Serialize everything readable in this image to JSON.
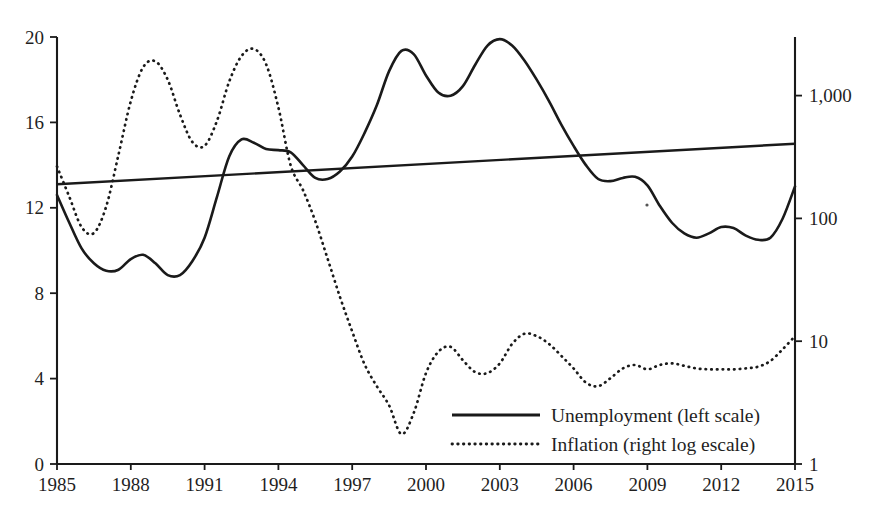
{
  "chart_data": {
    "type": "line",
    "title": "",
    "subtitle": "",
    "xlabel": "",
    "ylabel": "",
    "y2label": "",
    "xlim": [
      1985,
      2015
    ],
    "ylim": [
      0,
      20
    ],
    "y2lim": [
      1,
      3000
    ],
    "y2scale": "log",
    "grid": false,
    "legend_position": "bottom-right",
    "x_tick_labels": [
      "1985",
      "1988",
      "1991",
      "1994",
      "1997",
      "2000",
      "2003",
      "2006",
      "2009",
      "2012",
      "2015"
    ],
    "x_ticks": [
      1985,
      1988,
      1991,
      1994,
      1997,
      2000,
      2003,
      2006,
      2009,
      2012,
      2015
    ],
    "y_tick_labels": [
      "0",
      "4",
      "8",
      "12",
      "16",
      "20"
    ],
    "y_ticks": [
      0,
      4,
      8,
      12,
      16,
      20
    ],
    "y2_tick_labels": [
      "1",
      "10",
      "100",
      "1,000"
    ],
    "y2_ticks": [
      1,
      10,
      100,
      1000
    ],
    "series": [
      {
        "name": "Unemployment (left scale)",
        "axis": "left",
        "style": "solid",
        "color": "#1a1a1a",
        "x": [
          1985,
          1985.5,
          1986,
          1986.5,
          1987,
          1987.5,
          1988,
          1988.5,
          1989,
          1989.5,
          1990,
          1990.5,
          1991,
          1991.5,
          1992,
          1992.5,
          1993,
          1993.5,
          1994,
          1994.5,
          1995,
          1995.5,
          1996,
          1996.5,
          1997,
          1997.5,
          1998,
          1998.5,
          1999,
          1999.5,
          2000,
          2000.5,
          2001,
          2001.5,
          2002,
          2002.5,
          2003,
          2003.5,
          2004,
          2004.5,
          2005,
          2005.5,
          2006,
          2006.5,
          2007,
          2007.5,
          2008,
          2008.5,
          2009,
          2009.5,
          2010,
          2010.5,
          2011,
          2011.5,
          2012,
          2012.5,
          2013,
          2013.5,
          2014,
          2014.5,
          2015
        ],
        "values": [
          12.6,
          11.3,
          10.1,
          9.4,
          9.05,
          9.1,
          9.6,
          9.8,
          9.4,
          8.85,
          8.85,
          9.5,
          10.6,
          12.5,
          14.4,
          15.2,
          15.05,
          14.75,
          14.7,
          14.6,
          14.0,
          13.4,
          13.35,
          13.7,
          14.4,
          15.5,
          16.8,
          18.4,
          19.35,
          19.2,
          18.2,
          17.4,
          17.25,
          17.7,
          18.7,
          19.6,
          19.9,
          19.6,
          18.9,
          18.0,
          17.0,
          15.9,
          14.9,
          14.0,
          13.35,
          13.25,
          13.4,
          13.45,
          13.05,
          12.1,
          11.3,
          10.8,
          10.6,
          10.8,
          11.1,
          11.05,
          10.7,
          10.5,
          10.6,
          11.5,
          13.0
        ]
      },
      {
        "name": "Inflation (right log escale)",
        "axis": "right",
        "style": "dotted",
        "color": "#1a1a1a",
        "x": [
          1985,
          1985.5,
          1986,
          1986.5,
          1987,
          1987.5,
          1988,
          1988.5,
          1989,
          1989.5,
          1990,
          1990.5,
          1991,
          1991.5,
          1992,
          1992.5,
          1993,
          1993.5,
          1994,
          1994.5,
          1995,
          1995.5,
          1996,
          1996.5,
          1997,
          1997.5,
          1998,
          1998.5,
          1999,
          1999.5,
          2000,
          2000.5,
          2001,
          2001.5,
          2002,
          2002.5,
          2003,
          2003.5,
          2004,
          2004.5,
          2005,
          2005.5,
          2006,
          2006.5,
          2007,
          2007.5,
          2008,
          2008.5,
          2009,
          2009.5,
          2010,
          2010.5,
          2011,
          2011.5,
          2012,
          2012.5,
          2013,
          2013.5,
          2014,
          2014.5,
          2015
        ],
        "values": [
          265,
          150,
          85,
          76,
          125,
          330,
          900,
          1700,
          1900,
          1350,
          700,
          420,
          390,
          620,
          1300,
          2100,
          2400,
          1800,
          800,
          270,
          170,
          95,
          47,
          23,
          12,
          6.5,
          4.3,
          3.0,
          1.75,
          2.6,
          5.5,
          8.2,
          9.0,
          7.0,
          5.6,
          5.5,
          6.6,
          9.5,
          11.5,
          11.0,
          9.5,
          7.6,
          6.0,
          4.6,
          4.3,
          5.0,
          6.0,
          6.4,
          5.9,
          6.4,
          6.6,
          6.3,
          6.0,
          5.9,
          5.9,
          5.9,
          6.0,
          6.2,
          6.9,
          8.6,
          11.0
        ]
      },
      {
        "name": "trend-line",
        "axis": "left",
        "style": "solid-straight",
        "color": "#1a1a1a",
        "x": [
          1985,
          2015
        ],
        "values": [
          13.1,
          15.0
        ]
      }
    ]
  },
  "legend": {
    "entries": [
      {
        "label": "Unemployment (left scale)",
        "style": "solid"
      },
      {
        "label": "Inflation (right log escale)",
        "style": "dotted"
      }
    ]
  },
  "axes": {
    "left_ticks": [
      "20",
      "16",
      "12",
      "8",
      "4",
      "0"
    ],
    "right_ticks": [
      "1,000",
      "100",
      "10",
      "1"
    ],
    "bottom_ticks": [
      "1985",
      "1988",
      "1991",
      "1994",
      "1997",
      "2000",
      "2003",
      "2006",
      "2009",
      "2012",
      "2015"
    ]
  }
}
